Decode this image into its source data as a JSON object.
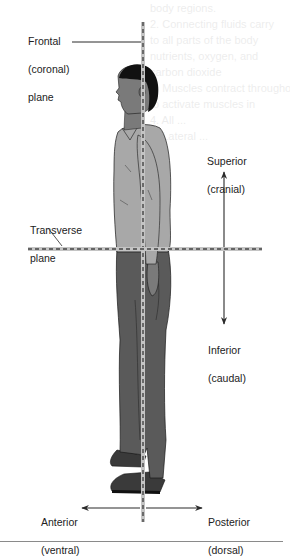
{
  "diagram": {
    "planes": [
      {
        "id": "frontal",
        "label_line1": "Frontal",
        "label_line2": "(coronal)",
        "label_line3": "plane",
        "orientation": "vertical"
      },
      {
        "id": "transverse",
        "label_line1": "Transverse",
        "label_line2": "plane",
        "orientation": "horizontal"
      }
    ],
    "directions": {
      "superior": {
        "term": "Superior",
        "synonym": "(cranial)"
      },
      "inferior": {
        "term": "Inferior",
        "synonym": "(caudal)"
      },
      "anterior": {
        "term": "Anterior",
        "synonym": "(ventral)"
      },
      "posterior": {
        "term": "Posterior",
        "synonym": "(dorsal)"
      }
    },
    "figure": "Standing male figure in profile, facing left",
    "colors": {
      "skin": "#7a7a7a",
      "hair": "#111111",
      "shirt": "#a8a8a8",
      "pants": "#5a5a5a",
      "shoes": "#3a3a3a",
      "plane_line": "#b9b9b9",
      "plane_dash": "#444444",
      "arrow": "#2a2a2a"
    }
  },
  "background_bleed": [
    "body regions.",
    "2. Connecting fluids carry",
    "to all parts of the body",
    "nutrients, oxygen, and",
    "carbon dioxide",
    "3. Muscles contract throughout",
    "to activate muscles in",
    "4. All ...",
    "5. Lateral ..."
  ]
}
